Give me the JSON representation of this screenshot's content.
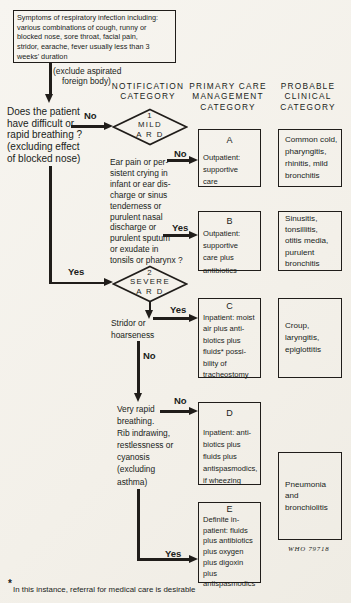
{
  "colors": {
    "ink": "#201d1a",
    "paper": "#f4f2ec"
  },
  "symptoms_box": "Symptoms of respiratory infection including:\nvarious combinations of cough, runny or\nblocked nose, sore throat, facial pain,\nstridor, earache, fever usually less than 3\nweeks' duration",
  "exclude_note": {
    "line1": "(exclude aspirated",
    "line2": "foreign body)"
  },
  "headers": {
    "notification": "NOTIFICATION\nCATEGORY",
    "primary": "PRIMARY CARE\nMANAGEMENT\nCATEGORY",
    "probable": "PROBABLE\nCLINICAL\nCATEGORY"
  },
  "question": "Does the patient\nhave difficult or\nrapid breathing ?\n(excluding effect\nof blocked nose)",
  "labels": {
    "question_no": "No",
    "mild_no": "No",
    "mild_yes": "Yes",
    "severe_yes": "Yes",
    "stridor_yes": "Yes",
    "stridor_no": "No",
    "rapid_no": "No",
    "rapid_yes": "Yes"
  },
  "diamond1": {
    "number": "1",
    "name": "MILD",
    "type": "A R D"
  },
  "diamond2": {
    "number": "2",
    "name": "SEVERE",
    "type": "A R D"
  },
  "ear_criteria": "Ear pain or per-\nsistent crying in\ninfant or ear dis-\ncharge or sinus\ntenderness or\npurulent nasal\ndischarge or\npurulent sputum\nor exudate in\ntonsils or pharynx ?",
  "stridor": "Stridor or\nhoarseness",
  "very_rapid": "Very rapid\nbreathing.\nRib indrawing,\nrestlessness or\ncyanosis\n(excluding\nasthma)",
  "management": {
    "a": {
      "letter": "A",
      "text": "Outpatient:\nsupportive\ncare"
    },
    "b": {
      "letter": "B",
      "text": "Outpatient:\nsupportive\ncare plus\nantibiotics"
    },
    "c": {
      "letter": "C",
      "text": "Inpatient: moist\nair plus anti-\nbiotics plus\nfluids* possi-\nbility of\ntracheostomy"
    },
    "d": {
      "letter": "D",
      "text": "Inpatient: anti-\nbiotics plus\nfluids plus\nantispasmodics,\nif wheezing"
    },
    "e": {
      "letter": "E",
      "text": "Definite in-\npatient: fluids\nplus antibiotics\nplus oxygen\nplus digoxin\nplus\nantispasmodics"
    }
  },
  "clinical": {
    "one": "Common cold,\npharyngitis,\nrhinitis, mild\nbronchitis",
    "two": "Sinusitis,\ntonsillitis,\notitis media,\npurulent\nbronchitis",
    "three": "Croup,\nlaryngitis,\nepiglottitis",
    "four": "Pneumonia\nand\nbronchiolitis"
  },
  "credit": "WHO 79718",
  "footnote": {
    "star": "*",
    "text": "In this instance, referral for medical care is desirable"
  }
}
